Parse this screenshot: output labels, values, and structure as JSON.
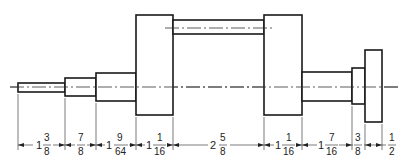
{
  "diagram": {
    "type": "technical-drawing",
    "colors": {
      "line": "#1a1a1a",
      "background": "#ffffff"
    },
    "dimensions": [
      {
        "id": "d1",
        "whole": "1",
        "num": "3",
        "den": "8"
      },
      {
        "id": "d2",
        "whole": "",
        "num": "7",
        "den": "8"
      },
      {
        "id": "d3",
        "whole": "1",
        "num": "9",
        "den": "64"
      },
      {
        "id": "d4",
        "whole": "1",
        "num": "1",
        "den": "16"
      },
      {
        "id": "d5",
        "whole": "2",
        "num": "5",
        "den": "8"
      },
      {
        "id": "d6",
        "whole": "1",
        "num": "1",
        "den": "16"
      },
      {
        "id": "d7",
        "whole": "1",
        "num": "7",
        "den": "16"
      },
      {
        "id": "d8",
        "whole": "",
        "num": "3",
        "den": "8"
      },
      {
        "id": "d9",
        "whole": "",
        "num": "1",
        "den": "2"
      }
    ]
  }
}
